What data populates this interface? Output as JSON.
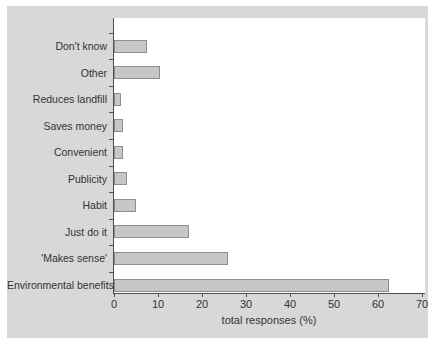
{
  "chart_data": {
    "type": "bar",
    "orientation": "horizontal",
    "title": "",
    "xlabel": "total responses (%)",
    "ylabel": "",
    "xlim": [
      0,
      70
    ],
    "xticks": [
      0,
      10,
      20,
      30,
      40,
      50,
      60,
      70
    ],
    "grid": false,
    "legend": null,
    "categories": [
      "Don't know",
      "Other",
      "Reduces landfill",
      "Saves money",
      "Convenient",
      "Publicity",
      "Habit",
      "Just do it",
      "'Makes sense'",
      "Environmental benefits"
    ],
    "values": [
      7.5,
      10.5,
      1.5,
      2,
      2,
      3,
      5,
      17,
      26,
      62.5
    ],
    "colors": {
      "panel_background": "#d8d8d8",
      "plot_background": "#ffffff",
      "bar_fill": "#c7c7c5",
      "bar_border": "#8e8e8e",
      "axis": "#4f4f4f",
      "text": "#333333"
    }
  }
}
